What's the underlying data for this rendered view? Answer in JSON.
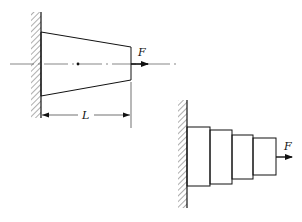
{
  "figure_a": {
    "description": "Tapered bar fixed to wall, axial load F at free end",
    "force_label": "F",
    "length_label": "L",
    "wall": {
      "x": 41,
      "y1": 12,
      "y2": 118
    },
    "bar": {
      "left_top": 30,
      "left_bottom": 98,
      "right_x": 131,
      "right_top": 47,
      "right_bottom": 80
    },
    "centerline_y": 64,
    "centroid_dot": {
      "x": 78,
      "y": 64
    }
  },
  "figure_b": {
    "description": "Stepped bar with four segments fixed to wall, axial load F at free end",
    "force_label": "F",
    "wall": {
      "x": 187,
      "y1": 100,
      "y2": 208
    },
    "steps": [
      {
        "x1": 187,
        "x2": 210,
        "y1": 127,
        "y2": 186
      },
      {
        "x1": 210,
        "x2": 232,
        "y1": 130,
        "y2": 184
      },
      {
        "x1": 232,
        "x2": 253,
        "y1": 135,
        "y2": 179
      },
      {
        "x1": 253,
        "x2": 276,
        "y1": 138,
        "y2": 175
      }
    ]
  }
}
